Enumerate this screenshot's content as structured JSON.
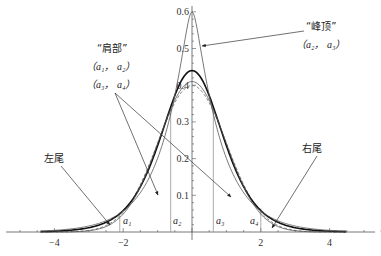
{
  "chart_data": {
    "type": "line",
    "title": "",
    "xlabel": "",
    "ylabel": "",
    "xlim": [
      -5.4,
      5.6
    ],
    "ylim": [
      0,
      0.62
    ],
    "x_ticks": [
      -4,
      -2,
      0,
      2,
      4
    ],
    "x_tick_labels": [
      "−4",
      "−2",
      "",
      "2",
      "4"
    ],
    "y_ticks": [
      0.1,
      0.2,
      0.3,
      0.4,
      0.5,
      0.6
    ],
    "y_tick_labels": [
      "0.1",
      "0.2",
      "0.3",
      "0.4",
      "0.5",
      "0.6"
    ],
    "grid": false,
    "series": [
      {
        "name": "normal",
        "kind": "normal",
        "sigma": 1.0,
        "peak": 0.399,
        "style": "dashed"
      },
      {
        "name": "bold",
        "kind": "logistic_like",
        "peak": 0.44,
        "style": "bold"
      },
      {
        "name": "thin",
        "kind": "normal",
        "sigma": 0.97,
        "peak": 0.41,
        "style": "thin"
      },
      {
        "name": "peaked",
        "kind": "laplace",
        "b": 0.833,
        "peak": 0.6,
        "style": "thin"
      }
    ],
    "vertical_markers": [
      {
        "label": "a1",
        "sub": "1",
        "x": -2.1
      },
      {
        "label": "a2",
        "sub": "2",
        "x": -0.62
      },
      {
        "label": "a3",
        "sub": "3",
        "x": 0.62
      },
      {
        "label": "a4",
        "sub": "4",
        "x": 2.0
      }
    ],
    "annotations": [
      {
        "id": "peak",
        "text": "“峰顶”",
        "sub_text": "（a₂，a₃）"
      },
      {
        "id": "shoulder",
        "text": "“肩部”",
        "sub_text_1": "（a₁，a₂）",
        "sub_text_2": "（a₃，a₄）"
      },
      {
        "id": "left_tail",
        "text": "左尾"
      },
      {
        "id": "right_tail",
        "text": "右尾"
      }
    ]
  },
  "labels": {
    "peak_title": "“峰顶”",
    "peak_range": "（a₂， a₃）",
    "shoulder_title": "“肩部”",
    "shoulder_range1": "（a₁， a₂）",
    "shoulder_range2": "（a₃， a₄）",
    "left_tail": "左尾",
    "right_tail": "右尾",
    "a1": "a₁",
    "a2": "a₂",
    "a3": "a₃",
    "a4": "a₄"
  },
  "colors": {
    "axis": "#555555",
    "curve": "#222222",
    "thin": "#555555",
    "marker": "#888888"
  }
}
